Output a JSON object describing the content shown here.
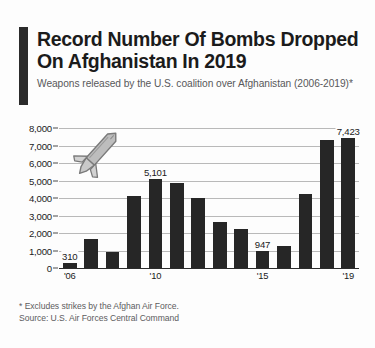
{
  "header": {
    "title": "Record Number Of Bombs Dropped On Afghanistan In 2019",
    "subtitle": "Weapons released by the U.S. coalition over Afghanistan (2006-2019)*",
    "accent_color": "#2b2b2b"
  },
  "footer": {
    "footnote": "* Excludes strikes by the Afghan Air Force.",
    "source": "Source: U.S. Air Forces Central Command"
  },
  "icons": {
    "bomb": "bomb-icon",
    "bomb_fill": "#b3b3b3",
    "bomb_stroke": "#7d7d7d"
  },
  "chart_data": {
    "type": "bar",
    "title": "Record Number Of Bombs Dropped On Afghanistan In 2019",
    "subtitle": "Weapons released by the U.S. coalition over Afghanistan (2006-2019)*",
    "xlabel": "",
    "ylabel": "",
    "ylim": [
      0,
      8000
    ],
    "yticks": [
      0,
      1000,
      2000,
      3000,
      4000,
      5000,
      6000,
      7000,
      8000
    ],
    "ytick_labels": [
      "0",
      "1,000",
      "2,000",
      "3,000",
      "4,000",
      "5,000",
      "6,000",
      "7,000",
      "8,000"
    ],
    "grid": true,
    "legend": "none",
    "bar_color": "#262626",
    "categories": [
      "2006",
      "2007",
      "2008",
      "2009",
      "2010",
      "2011",
      "2012",
      "2013",
      "2014",
      "2015",
      "2016",
      "2017",
      "2018",
      "2019"
    ],
    "xtick_labels": [
      "'06",
      "",
      "",
      "",
      "'10",
      "",
      "",
      "",
      "",
      "'15",
      "",
      "",
      "",
      "'19"
    ],
    "values": [
      310,
      1650,
      900,
      4100,
      5101,
      4850,
      4000,
      2650,
      2250,
      947,
      1250,
      4250,
      7300,
      7423
    ],
    "data_labels": [
      "310",
      "",
      "",
      "",
      "5,101",
      "",
      "",
      "",
      "",
      "947",
      "",
      "",
      "",
      "7,423"
    ],
    "annotations": [
      {
        "name": "bomb-icon",
        "description": "gray missile/bomb graphic angled over upper-left plot area"
      }
    ]
  }
}
